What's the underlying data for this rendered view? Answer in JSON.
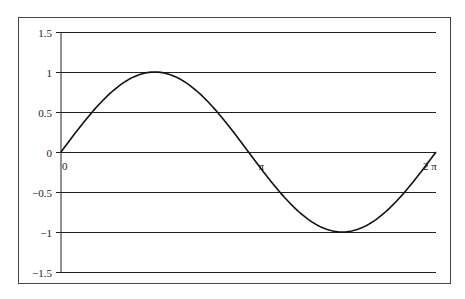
{
  "chart_data": {
    "type": "line",
    "title": "",
    "xlabel": "",
    "ylabel": "",
    "function": "y = sin(x)",
    "x_range": [
      0,
      6.2832
    ],
    "ylim": [
      -1.5,
      1.5
    ],
    "grid": {
      "horizontal": true,
      "vertical": false
    },
    "legend": null,
    "y_ticks": [
      1.5,
      1,
      0.5,
      0,
      -0.5,
      -1,
      -1.5
    ],
    "y_tick_labels": [
      "1.5",
      "1",
      "0.5",
      "0",
      "−0.5",
      "−1",
      "−1.5"
    ],
    "x_annotations": [
      {
        "x": 0,
        "label": "0"
      },
      {
        "x": 3.1416,
        "label": "π"
      },
      {
        "x": 6.2832,
        "label": "2 π"
      }
    ],
    "series": [
      {
        "name": "sin(x)",
        "x": [
          0,
          0.7854,
          1.5708,
          2.3562,
          3.1416,
          3.927,
          4.7124,
          5.4978,
          6.2832
        ],
        "values": [
          0,
          0.707,
          1,
          0.707,
          0,
          -0.707,
          -1,
          -0.707,
          0
        ]
      }
    ],
    "colors": {
      "line": "#111111",
      "grid": "#222222",
      "frame": "#444444",
      "background": "#ffffff"
    }
  }
}
